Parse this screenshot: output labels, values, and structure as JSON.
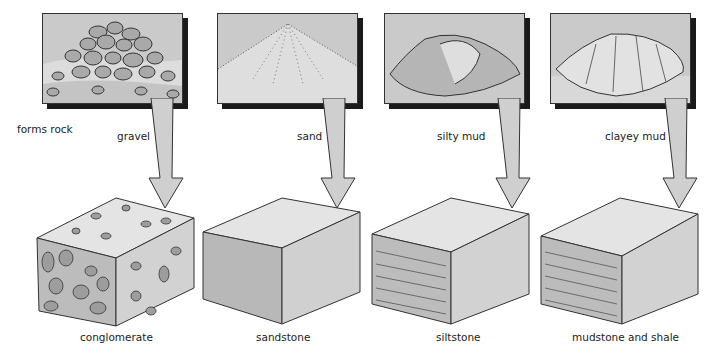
{
  "side_label": "forms rock",
  "columns": [
    {
      "sediment": "gravel",
      "rock": "conglomerate"
    },
    {
      "sediment": "sand",
      "rock": "sandstone"
    },
    {
      "sediment": "silty mud",
      "rock": "siltstone"
    },
    {
      "sediment": "clayey mud",
      "rock": "mudstone and shale"
    }
  ],
  "colors": {
    "panel_bg": "#c8c8c8",
    "ground": "#dcdcdc",
    "arrow_fill": "#cfcfcf",
    "cube_top": "#e6e6e6",
    "cube_front": "#bdbdbd",
    "cube_side": "#d3d3d3",
    "outline": "#333333"
  }
}
